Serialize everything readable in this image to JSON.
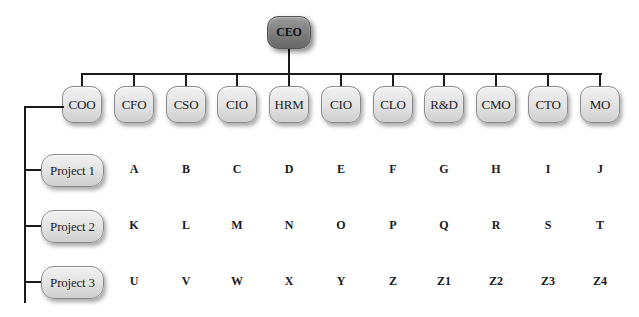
{
  "ceo": {
    "label": "CEO"
  },
  "executives": [
    {
      "label": "COO",
      "x": 82
    },
    {
      "label": "CFO",
      "x": 134
    },
    {
      "label": "CSO",
      "x": 186
    },
    {
      "label": "CIO",
      "x": 237
    },
    {
      "label": "HRM",
      "x": 289
    },
    {
      "label": "CIO",
      "x": 341
    },
    {
      "label": "CLO",
      "x": 393
    },
    {
      "label": "R&D",
      "x": 444
    },
    {
      "label": "CMO",
      "x": 496
    },
    {
      "label": "CTO",
      "x": 548
    },
    {
      "label": "MO",
      "x": 600
    }
  ],
  "projects": [
    {
      "label": "Project 1",
      "cells": [
        "A",
        "B",
        "C",
        "D",
        "E",
        "F",
        "G",
        "H",
        "I",
        "J"
      ]
    },
    {
      "label": "Project 2",
      "cells": [
        "K",
        "L",
        "M",
        "N",
        "O",
        "P",
        "Q",
        "R",
        "S",
        "T"
      ]
    },
    {
      "label": "Project 3",
      "cells": [
        "U",
        "V",
        "W",
        "X",
        "Y",
        "Z",
        "Z1",
        "Z2",
        "Z3",
        "Z4"
      ]
    }
  ]
}
